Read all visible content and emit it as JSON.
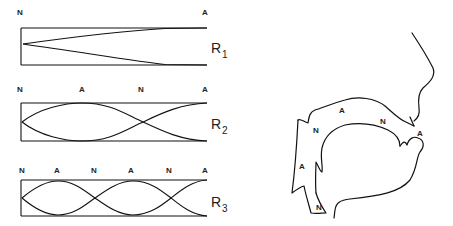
{
  "figure": {
    "resonances": [
      {
        "id": "R1",
        "label_main": "R",
        "label_sub": "1",
        "markers": [
          "N",
          "A"
        ]
      },
      {
        "id": "R2",
        "label_main": "R",
        "label_sub": "2",
        "markers": [
          "N",
          "A",
          "N",
          "A"
        ]
      },
      {
        "id": "R3",
        "label_main": "R",
        "label_sub": "3",
        "markers": [
          "N",
          "A",
          "N",
          "A",
          "N",
          "A"
        ]
      }
    ],
    "vocal_tract": {
      "labels": [
        {
          "text": "A",
          "position": "palate"
        },
        {
          "text": "N",
          "position": "velum"
        },
        {
          "text": "N",
          "position": "upper-pharynx"
        },
        {
          "text": "A",
          "position": "lips"
        },
        {
          "text": "A",
          "position": "pharynx"
        },
        {
          "text": "N",
          "position": "glottis"
        }
      ]
    }
  }
}
